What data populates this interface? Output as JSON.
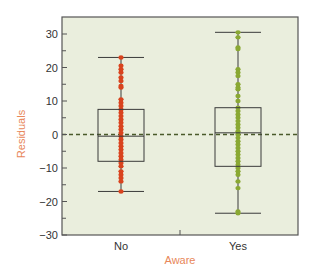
{
  "chart_data": {
    "type": "box",
    "title": "",
    "xlabel": "Aware",
    "ylabel": "Residuals",
    "ylim": [
      -30,
      35
    ],
    "yticks": [
      30,
      20,
      10,
      0,
      -10,
      -20,
      -30
    ],
    "yminor_ticks": [
      25,
      15,
      5,
      -5,
      -15,
      -25
    ],
    "categories": [
      "No",
      "Yes"
    ],
    "reference_line": {
      "y": 0,
      "style": "dashed"
    },
    "colors": {
      "plot_background": "#eaeedd",
      "no": "#d9431e",
      "yes": "#8aa833",
      "box_stroke": "#3a3a3a",
      "frame": "#555555",
      "axis_title": "#e8875a",
      "reference_line": "#4a5a2a"
    },
    "series": [
      {
        "name": "No",
        "whisker_high": 23,
        "q3": 7.5,
        "median": -0.5,
        "q1": -8,
        "whisker_low": -17,
        "points": [
          23,
          20.5,
          19.5,
          18.5,
          17,
          16,
          14.5,
          14,
          10.5,
          9.5,
          8.5,
          7.5,
          6.5,
          5.5,
          4.5,
          3.5,
          2.5,
          1.5,
          0.5,
          -0.5,
          -1.5,
          -2.5,
          -3.5,
          -4.5,
          -5.5,
          -6.5,
          -7.5,
          -8.5,
          -9.5,
          -11,
          -12,
          -13,
          -14,
          -17
        ]
      },
      {
        "name": "Yes",
        "whisker_high": 30.5,
        "q3": 8,
        "median": 0.5,
        "q1": -9.5,
        "whisker_low": -23.5,
        "points": [
          30.5,
          29,
          26,
          25.5,
          19.5,
          18.5,
          17.5,
          15,
          14,
          13.5,
          11.5,
          10,
          8,
          7,
          6,
          5,
          4,
          3,
          2,
          1,
          0,
          -1,
          -2,
          -3,
          -4,
          -5,
          -6,
          -7,
          -8,
          -9,
          -10,
          -11,
          -12,
          -14,
          -16,
          -23.5,
          -23
        ]
      }
    ]
  }
}
